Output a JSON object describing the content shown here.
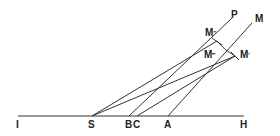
{
  "diagram": {
    "stroke_color": "#333333",
    "labels": {
      "I": "I",
      "S": "S",
      "B": "B",
      "C": "C",
      "A": "A",
      "H": "H",
      "P": "P",
      "M": "M",
      "M2": "M",
      "M2_prime": "″",
      "M1": "M",
      "M1_prime": "′",
      "M3": "M",
      "M3_prime": "‴"
    },
    "points": {
      "I": [
        18,
        116
      ],
      "S": [
        92,
        116
      ],
      "B": [
        129,
        116
      ],
      "C": [
        137,
        116
      ],
      "A": [
        168,
        116
      ],
      "H": [
        244,
        116
      ],
      "M_double": [
        217,
        41
      ],
      "M_single": [
        235,
        56
      ],
      "P_end": [
        232,
        18
      ],
      "M_end": [
        252,
        23
      ]
    }
  }
}
